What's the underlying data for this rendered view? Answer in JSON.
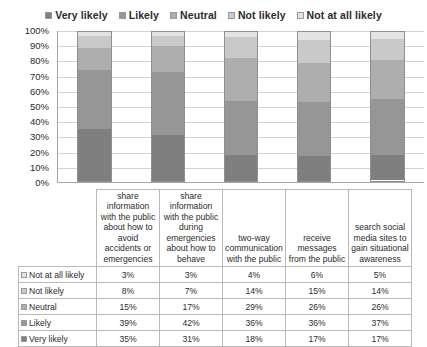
{
  "chart_data": {
    "type": "bar",
    "subtype": "stacked-percent",
    "title": "",
    "xlabel": "",
    "ylabel": "",
    "ylim": [
      0,
      100
    ],
    "ytick_labels": [
      "100%",
      "90%",
      "80%",
      "70%",
      "60%",
      "50%",
      "40%",
      "30%",
      "20%",
      "10%",
      "0%"
    ],
    "ytick_values": [
      100,
      90,
      80,
      70,
      60,
      50,
      40,
      30,
      20,
      10,
      0
    ],
    "grid": true,
    "legend_position": "top",
    "categories": [
      "share information with the public about how to avoid accidents or emergencies",
      "share information with the public during emergencies about how to behave",
      "two-way communication with the public",
      "receive messages from the public",
      "search social media sites to gain situational awareness"
    ],
    "series": [
      {
        "name": "Very likely",
        "color": "#7f7f7f",
        "values": [
          35,
          31,
          18,
          17,
          17
        ],
        "labels": [
          "35%",
          "31%",
          "18%",
          "17%",
          "17%"
        ]
      },
      {
        "name": "Likely",
        "color": "#969696",
        "values": [
          39,
          42,
          36,
          36,
          37
        ],
        "labels": [
          "39%",
          "42%",
          "36%",
          "36%",
          "37%"
        ]
      },
      {
        "name": "Neutral",
        "color": "#aeaeae",
        "values": [
          15,
          17,
          29,
          26,
          26
        ],
        "labels": [
          "15%",
          "17%",
          "29%",
          "26%",
          "26%"
        ]
      },
      {
        "name": "Not likely",
        "color": "#c9c9c9",
        "values": [
          8,
          7,
          14,
          15,
          14
        ],
        "labels": [
          "8%",
          "7%",
          "14%",
          "15%",
          "14%"
        ]
      },
      {
        "name": "Not at all likely",
        "color": "#e3e3e3",
        "values": [
          3,
          3,
          4,
          6,
          5
        ],
        "labels": [
          "3%",
          "3%",
          "4%",
          "6%",
          "5%"
        ]
      }
    ]
  },
  "legend": {
    "items": [
      {
        "label": "Very likely",
        "color": "#7f7f7f"
      },
      {
        "label": "Likely",
        "color": "#969696"
      },
      {
        "label": "Neutral",
        "color": "#aeaeae"
      },
      {
        "label": "Not likely",
        "color": "#c9c9c9"
      },
      {
        "label": "Not at all likely",
        "color": "#e3e3e3"
      }
    ]
  },
  "table": {
    "category_headers": [
      "share information with the public about how to avoid accidents or emergencies",
      "share information with the public during emergencies about how to behave",
      "two-way communication with the public",
      "receive messages from the public",
      "search social media sites to gain situational awareness"
    ],
    "rows": [
      {
        "label": "Not at all likely",
        "color": "#e3e3e3",
        "values": [
          "3%",
          "3%",
          "4%",
          "6%",
          "5%"
        ]
      },
      {
        "label": "Not likely",
        "color": "#c9c9c9",
        "values": [
          "8%",
          "7%",
          "14%",
          "15%",
          "14%"
        ]
      },
      {
        "label": "Neutral",
        "color": "#aeaeae",
        "values": [
          "15%",
          "17%",
          "29%",
          "26%",
          "26%"
        ]
      },
      {
        "label": "Likely",
        "color": "#969696",
        "values": [
          "39%",
          "42%",
          "36%",
          "36%",
          "37%"
        ]
      },
      {
        "label": "Very likely",
        "color": "#7f7f7f",
        "values": [
          "35%",
          "31%",
          "18%",
          "17%",
          "17%"
        ]
      }
    ]
  }
}
